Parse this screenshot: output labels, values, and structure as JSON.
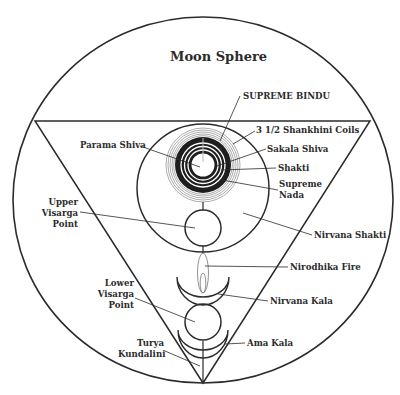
{
  "diagram": {
    "title": "Moon Sphere",
    "labels": {
      "supreme_bindu": "SUPREME BINDU",
      "shankhini_coils": "3 1/2 Shankhini Coils",
      "parama_shiva": "Parama Shiva",
      "sakala_shiva": "Sakala Shiva",
      "shakti": "Shakti",
      "supreme_nada_1": "Supreme",
      "supreme_nada_2": "Nada",
      "upper_visarga_1": "Upper",
      "upper_visarga_2": "Visarga",
      "upper_visarga_3": "Point",
      "nirvana_shakti": "Nirvana Shakti",
      "nirodhika_fire": "Nirodhika Fire",
      "lower_visarga_1": "Lower",
      "lower_visarga_2": "Visarga",
      "lower_visarga_3": "Point",
      "nirvana_kala": "Nirvana Kala",
      "turya_1": "Turya",
      "turya_2": "Kundalini",
      "ama_kala": "Ama Kala"
    },
    "colors": {
      "line": "#2b2b2b",
      "coil_grey": "#8a8a8a",
      "background": "#ffffff"
    }
  }
}
